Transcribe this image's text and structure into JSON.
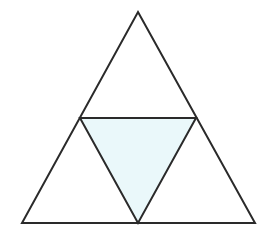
{
  "diagram": {
    "type": "triangle-subdivision",
    "colors": {
      "background": "#ffffff",
      "stroke": "#2a2a2a",
      "shaded_fill": "#eaf8fa",
      "unshaded_fill": "#ffffff"
    },
    "stroke_width": 2,
    "vertices": {
      "top": [
        138,
        12
      ],
      "bottom_left": [
        22,
        223
      ],
      "bottom_right": [
        255,
        223
      ]
    },
    "midpoints": {
      "left": [
        80,
        118
      ],
      "right": [
        196,
        118
      ],
      "bottom": [
        138,
        223
      ]
    },
    "regions": [
      {
        "name": "top-triangle",
        "points": "138,12 196,118 80,118",
        "shaded": false
      },
      {
        "name": "bottom-left-triangle",
        "points": "80,118 138,223 22,223",
        "shaded": false
      },
      {
        "name": "bottom-right-triangle",
        "points": "196,118 255,223 138,223",
        "shaded": false
      },
      {
        "name": "center-triangle",
        "points": "80,118 196,118 138,223",
        "shaded": true
      }
    ],
    "counts": {
      "total_small_triangles": 4,
      "shaded_triangles": 1
    }
  }
}
